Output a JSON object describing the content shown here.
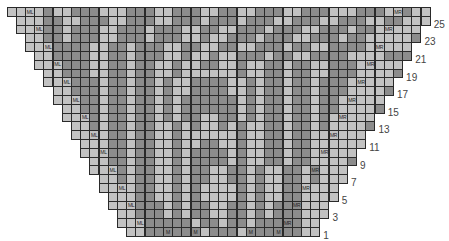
{
  "chart": {
    "title": "",
    "type": "knitting-chart",
    "total_columns": 46,
    "total_rows": 26,
    "colors": {
      "light": "#c2c2c2",
      "dark": "#8c8c8c",
      "darker": "#7d7d7d",
      "grid": "#2a2a2a"
    },
    "legend_abbreviations": [
      "ML",
      "MR",
      "M"
    ],
    "row_numbers": [
      "25",
      "23",
      "21",
      "19",
      "17",
      "15",
      "13",
      "11",
      "9",
      "7",
      "5",
      "3",
      "1"
    ],
    "rows": [
      {
        "row": 26,
        "pattern": "LLLLDLLDDDLLLDDDLLDDDLLDDLLDDDLLDDDLLLDDDLLDLL",
        "labels": [
          {
            "col": 2,
            "text": "ML"
          },
          {
            "col": 42,
            "text": "MR"
          }
        ]
      },
      {
        "row": 25,
        "pattern": "LLLDDLLDDDLLDDDLLDDDLDDDLDDDLLDDDLLDDDLLDDLL",
        "labels": []
      },
      {
        "row": 24,
        "pattern": "LLLDDLDDDLLDDDLDDDLLDDLLDDDLDDDLLDDDLDDLLL",
        "labels": [
          {
            "col": 2,
            "text": "ML"
          },
          {
            "col": 40,
            "text": "MR"
          }
        ]
      },
      {
        "row": 23,
        "pattern": "LLDDLDDDLLDDDLDDDLLDLLDDDLDDDLLDDDLDDLLL",
        "labels": []
      },
      {
        "row": 22,
        "pattern": "LLLDDDDLLDDLDDDLLDDLLDDLLDDDLDDLLDDDDLLL",
        "labels": [
          {
            "col": 2,
            "text": "ML"
          },
          {
            "col": 38,
            "text": "MR"
          }
        ]
      },
      {
        "row": 21,
        "pattern": "LLDDDDLLDDLDDDLLDLLDLLDDDLDDLLDDDDLL",
        "labels": []
      },
      {
        "row": 20,
        "pattern": "LLLDDDLLDDLDDLLDLLDDLLDLLDDLDDLLDDDLLL",
        "labels": [
          {
            "col": 2,
            "text": "ML"
          },
          {
            "col": 35,
            "text": "MR"
          }
        ]
      },
      {
        "row": 19,
        "pattern": "LLDDDLLDDLDDLLDLLLLLLDLLDDLDDLLDDDLL",
        "labels": []
      },
      {
        "row": 18,
        "pattern": "LLLDDDLDDLDDLDLLDDDDLLDLDDLDDLDDDLLL",
        "labels": [
          {
            "col": 2,
            "text": "ML"
          },
          {
            "col": 33,
            "text": "MR"
          }
        ]
      },
      {
        "row": 17,
        "pattern": "LLDDDLDDLDDLDLLDDDDLLDLDDLDDLDDDLL",
        "labels": []
      },
      {
        "row": 16,
        "pattern": "LLLDDLDDLDDLDLDDDDDDLDLDDLDDLDDLLL",
        "labels": [
          {
            "col": 2,
            "text": "ML"
          },
          {
            "col": 31,
            "text": "MR"
          }
        ]
      },
      {
        "row": 15,
        "pattern": "LLDDLDDLDDLDLDDDDDDLDLDDLDDLDDLL",
        "labels": []
      },
      {
        "row": 14,
        "pattern": "LLLDLDDLDDLDLDDLLDDLDLDDLDDLDLLL",
        "labels": [
          {
            "col": 2,
            "text": "ML"
          },
          {
            "col": 29,
            "text": "MR"
          }
        ]
      },
      {
        "row": 13,
        "pattern": "LLDLDDLDDLLDLDLLDLDLLDDLDDLDLL",
        "labels": []
      },
      {
        "row": 12,
        "pattern": "LLLLDDLDDLLDLLLLLLDLLDDLDDLLLL",
        "labels": [
          {
            "col": 2,
            "text": "ML"
          },
          {
            "col": 27,
            "text": "MR"
          }
        ]
      },
      {
        "row": 11,
        "pattern": "LLLDDLDDLLDLLDDLLDLLDDLDDLLL",
        "labels": []
      },
      {
        "row": 10,
        "pattern": "LLLDDLDDLLDLDDDDLDLLDDLDDLLL",
        "labels": [
          {
            "col": 2,
            "text": "ML"
          },
          {
            "col": 25,
            "text": "MR"
          }
        ]
      },
      {
        "row": 9,
        "pattern": "LLDDLDDLLDLDDDDLDLLDDLDDLL",
        "labels": []
      },
      {
        "row": 8,
        "pattern": "LLLDLDDLLDLDDLLDDLDLLDDLDLLL",
        "labels": [
          {
            "col": 2,
            "text": "ML"
          },
          {
            "col": 23,
            "text": "MR"
          }
        ]
      },
      {
        "row": 7,
        "pattern": "LLDLDDLLDLDDLLDDLDLLDDLDLL",
        "labels": []
      },
      {
        "row": 6,
        "pattern": "LLLLDDLLDLDLLLLDLDLLDDLLLL",
        "labels": [
          {
            "col": 2,
            "text": "ML"
          },
          {
            "col": 21,
            "text": "MR"
          }
        ]
      },
      {
        "row": 5,
        "pattern": "LLLDDLLDLDLLLLDLDLLDDLLL",
        "labels": []
      },
      {
        "row": 4,
        "pattern": "LLLDDDLDLDDLLDDLDLDDDLLL",
        "labels": [
          {
            "col": 2,
            "text": "ML"
          },
          {
            "col": 19,
            "text": "MR"
          }
        ]
      },
      {
        "row": 3,
        "pattern": "LLDDDLDLDDLLDDLDLDDDLL",
        "labels": []
      },
      {
        "row": 2,
        "pattern": "LLLDDDDDLDDLDDLDDDDDLLL",
        "labels": [
          {
            "col": 2,
            "text": "ML"
          },
          {
            "col": 19,
            "text": "MR"
          }
        ]
      },
      {
        "row": 1,
        "pattern": "LLDDDDDDLDDDLDDDDDDLL",
        "labels": [
          {
            "col": 4,
            "text": "M"
          },
          {
            "col": 7,
            "text": "M"
          },
          {
            "col": 13,
            "text": "M"
          },
          {
            "col": 16,
            "text": "M"
          }
        ]
      }
    ]
  }
}
